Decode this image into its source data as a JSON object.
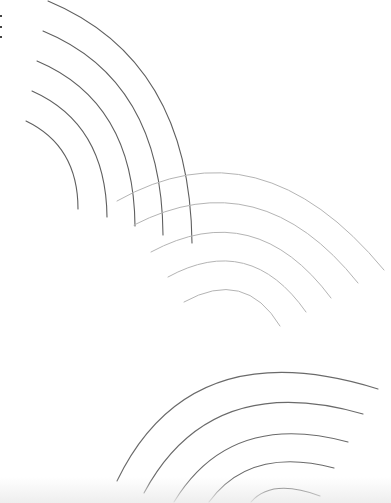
{
  "canvas": {
    "width": 391,
    "height": 503,
    "background": "#ffffff",
    "bottom_fade_color": "#ececec"
  },
  "menu": {
    "icon": "kebab-vertical-icon",
    "label": "More options"
  },
  "arc_groups": [
    {
      "name": "upper-left-arcs",
      "color": "#5f5f5f",
      "stroke_width": 1.1,
      "arcs": [
        {
          "start": [
            48,
            1
          ],
          "control": [
            190,
            60
          ],
          "end": [
            192,
            243
          ]
        },
        {
          "start": [
            43,
            31
          ],
          "control": [
            162,
            80
          ],
          "end": [
            163,
            235
          ]
        },
        {
          "start": [
            37,
            61
          ],
          "control": [
            134,
            102
          ],
          "end": [
            135,
            226
          ]
        },
        {
          "start": [
            32,
            91
          ],
          "control": [
            106,
            124
          ],
          "end": [
            107,
            217
          ]
        },
        {
          "start": [
            26,
            121
          ],
          "control": [
            78,
            146
          ],
          "end": [
            78,
            209
          ]
        }
      ]
    },
    {
      "name": "middle-arcs",
      "color": "#b4b4b4",
      "stroke_width": 1.0,
      "arcs": [
        {
          "start": [
            117,
            201
          ],
          "control": [
            260,
            120
          ],
          "end": [
            384,
            270
          ]
        },
        {
          "start": [
            134,
            225
          ],
          "control": [
            260,
            160
          ],
          "end": [
            358,
            283
          ]
        },
        {
          "start": [
            151,
            252
          ],
          "control": [
            255,
            196
          ],
          "end": [
            331,
            298
          ]
        },
        {
          "start": [
            168,
            277
          ],
          "control": [
            250,
            232
          ],
          "end": [
            306,
            312
          ]
        },
        {
          "start": [
            184,
            302
          ],
          "control": [
            245,
            268
          ],
          "end": [
            280,
            326
          ]
        }
      ]
    },
    {
      "name": "lower-right-arcs",
      "color": "#6a6a6a",
      "stroke_width": 1.1,
      "arcs": [
        {
          "start": [
            117,
            481
          ],
          "control": [
            190,
            330
          ],
          "end": [
            378,
            389
          ]
        },
        {
          "start": [
            144,
            493
          ],
          "control": [
            210,
            370
          ],
          "end": [
            363,
            414
          ]
        },
        {
          "start": [
            174,
            502
          ],
          "control": [
            230,
            410
          ],
          "end": [
            348,
            442
          ]
        },
        {
          "start": [
            209,
            502
          ],
          "control": [
            250,
            446
          ],
          "end": [
            334,
            468
          ]
        },
        {
          "start": [
            251,
            502
          ],
          "control": [
            272,
            478
          ],
          "end": [
            320,
            496
          ]
        }
      ]
    }
  ]
}
